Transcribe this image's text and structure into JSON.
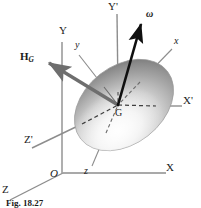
{
  "figure": {
    "kind": "mechanics-diagram",
    "caption": "Fig. 18.27",
    "background_color": "#ffffff",
    "body": {
      "name": "ellipsoid",
      "fill_light": "#f4f4f4",
      "fill_mid": "#b9b9b9",
      "fill_dark": "#767676",
      "outline_color": "#8a8a8a",
      "center_x": 124,
      "center_y": 105,
      "radius_x": 55,
      "radius_y": 39,
      "rotation_deg": -38
    },
    "center_point": {
      "label": "G",
      "x": 118,
      "y": 107
    },
    "vectors": [
      {
        "label": "ω",
        "name": "angular-velocity-vector",
        "color": "#101010",
        "width": 2.6,
        "from_x": 118,
        "from_y": 105,
        "to_x": 142,
        "to_y": 20,
        "label_x": 147,
        "label_y": 14,
        "style": "bold-italic-greek"
      },
      {
        "label": "H",
        "sublabel": "G",
        "name": "angular-momentum-vector",
        "color": "#6e6e6e",
        "width": 3.4,
        "from_x": 118,
        "from_y": 105,
        "to_x": 45,
        "to_y": 61,
        "label_x": 22,
        "label_y": 56,
        "style": "bold-upright"
      }
    ],
    "axes": [
      {
        "label": "Y'",
        "name": "axis-y-prime",
        "color": "#8d8d8d",
        "prime": true,
        "italic": false,
        "label_x": 110,
        "label_y": 3,
        "solid": [
          [
            117,
            14
          ],
          [
            118,
            92
          ]
        ],
        "dashed": [
          [
            118,
            92
          ],
          [
            118,
            105
          ]
        ]
      },
      {
        "label": "X'",
        "name": "axis-x-prime",
        "color": "#8d8d8d",
        "prime": true,
        "italic": false,
        "label_x": 185,
        "label_y": 98,
        "solid": [
          [
            155,
            106
          ],
          [
            182,
            106
          ]
        ],
        "dashed": [
          [
            118,
            105
          ],
          [
            155,
            106
          ]
        ]
      },
      {
        "label": "Z'",
        "name": "axis-z-prime",
        "color": "#8d8d8d",
        "prime": true,
        "italic": false,
        "label_x": 27,
        "label_y": 140,
        "solid": [
          [
            32,
            148
          ],
          [
            80,
            125
          ]
        ],
        "dashed": [
          [
            80,
            125
          ],
          [
            118,
            105
          ]
        ]
      },
      {
        "label": "Y",
        "name": "axis-y",
        "color": "#8d8d8d",
        "prime": false,
        "italic": false,
        "label_x": 62,
        "label_y": 30,
        "solid": [
          [
            62,
            42
          ],
          [
            62,
            173
          ]
        ],
        "dashed": []
      },
      {
        "label": "X",
        "name": "axis-x",
        "color": "#8d8d8d",
        "prime": false,
        "italic": false,
        "label_x": 168,
        "label_y": 167,
        "solid": [
          [
            63,
            173
          ],
          [
            166,
            173
          ]
        ],
        "dashed": []
      },
      {
        "label": "Z",
        "name": "axis-z",
        "color": "#8d8d8d",
        "prime": false,
        "italic": false,
        "label_x": 4,
        "label_y": 188,
        "solid": [
          [
            10,
            200
          ],
          [
            63,
            173
          ]
        ],
        "dashed": []
      },
      {
        "label": "x",
        "name": "body-axis-x",
        "color": "#8d8d8d",
        "prime": false,
        "italic": true,
        "label_x": 176,
        "label_y": 40,
        "solid": [
          [
            172,
            49
          ],
          [
            118,
            105
          ]
        ],
        "dashed": []
      },
      {
        "label": "y",
        "name": "body-axis-y",
        "color": "#8d8d8d",
        "prime": false,
        "italic": true,
        "label_x": 77,
        "label_y": 44,
        "solid": [
          [
            79,
            55
          ],
          [
            118,
            105
          ]
        ],
        "dashed": []
      },
      {
        "label": "z",
        "name": "body-axis-z",
        "color": "#8d8d8d",
        "prime": false,
        "italic": true,
        "label_x": 85,
        "label_y": 170,
        "solid": [
          [
            92,
            166
          ],
          [
            118,
            105
          ]
        ],
        "dashed": []
      }
    ],
    "origin": {
      "label": "O",
      "name": "origin-label",
      "x": 52,
      "y": 172
    }
  }
}
